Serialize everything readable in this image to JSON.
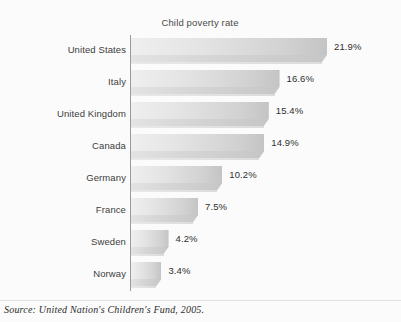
{
  "figure": {
    "title": "Child poverty rate",
    "source_note": "Source: United Nation's Children's Fund, 2005.",
    "background_color": "#fbfbfb",
    "axis_color": "#9a9a9a",
    "label_color": "#3d3d3d",
    "value_color": "#2f2f2f",
    "bar_color_light": "#efefef",
    "bar_color_dark": "#c4c4c4"
  },
  "chart_data": {
    "type": "bar",
    "orientation": "horizontal",
    "title": "Child poverty rate",
    "xlabel": "",
    "ylabel": "",
    "xlim": [
      0,
      24
    ],
    "grid": false,
    "legend": "none",
    "value_suffix": "%",
    "categories": [
      "United States",
      "Italy",
      "United Kingdom",
      "Canada",
      "Germany",
      "France",
      "Sweden",
      "Norway"
    ],
    "values": [
      21.9,
      16.6,
      15.4,
      14.9,
      10.2,
      7.5,
      4.2,
      3.4
    ],
    "value_labels": [
      "21.9%",
      "16.6%",
      "15.4%",
      "14.9%",
      "10.2%",
      "7.5%",
      "4.2%",
      "3.4%"
    ],
    "source": "Source: United Nation's Children's Fund, 2005."
  }
}
